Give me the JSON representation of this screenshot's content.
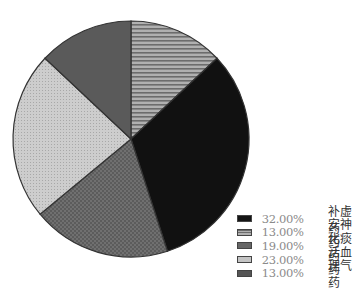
{
  "chart_data": {
    "type": "pie",
    "title": "",
    "start_angle": "12 o'clock, clockwise",
    "categories": [
      "补虚药",
      "安神药",
      "化痰药",
      "活血药",
      "理气药"
    ],
    "values": [
      32.0,
      13.0,
      19.0,
      23.0,
      13.0
    ],
    "value_labels": [
      "32.00%",
      "13.00%",
      "19.00%",
      "23.00%",
      "13.00%"
    ],
    "clockwise_order": [
      "安神药",
      "补虚药",
      "化痰药",
      "活血药",
      "理气药"
    ],
    "legend_position": "bottom-right",
    "fills": {
      "补虚药": {
        "color": "#111111",
        "pattern": "solid"
      },
      "安神药": {
        "color": "#8c8c8c",
        "pattern": "horizontal-stripes"
      },
      "化痰药": {
        "color": "#6a6a6a",
        "pattern": "checker"
      },
      "活血药": {
        "color": "#c4c4c4",
        "pattern": "fine-dots"
      },
      "理气药": {
        "color": "#5a5a5a",
        "pattern": "solid"
      }
    }
  },
  "legend": [
    {
      "pct": "32.00%",
      "name": "补虚药"
    },
    {
      "pct": "13.00%",
      "name": "安神药"
    },
    {
      "pct": "19.00%",
      "name": "化痰药"
    },
    {
      "pct": "23.00%",
      "name": "活血药"
    },
    {
      "pct": "13.00%",
      "name": "理气药"
    }
  ]
}
